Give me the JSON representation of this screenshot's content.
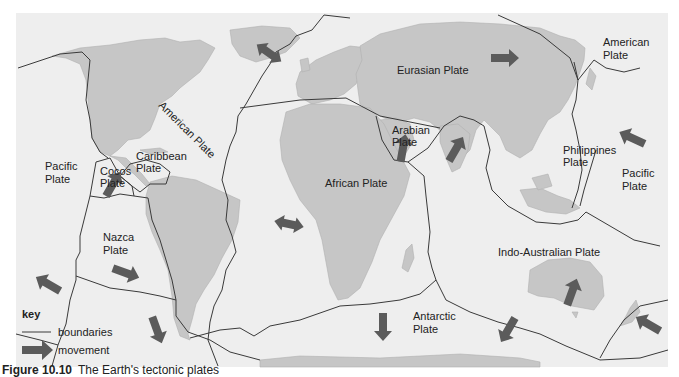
{
  "figure": {
    "caption_label": "Figure 10.10",
    "caption_text": "The Earth's tectonic plates"
  },
  "colors": {
    "ocean": "#eeeeee",
    "land": "#c6c6c6",
    "boundary": "#3a3a3a",
    "arrow": "#5b5b5b",
    "page": "#ffffff"
  },
  "plates": [
    {
      "id": "eurasian",
      "name": "Eurasian Plate"
    },
    {
      "id": "american-nw",
      "name": "American Plate"
    },
    {
      "id": "american-atl",
      "name": "American Plate"
    },
    {
      "id": "pacific-w",
      "name": "Pacific Plate"
    },
    {
      "id": "pacific-e",
      "name": "Pacific Plate"
    },
    {
      "id": "caribbean",
      "name": "Caribbean Plate"
    },
    {
      "id": "cocos",
      "name": "Cocos Plate"
    },
    {
      "id": "nazca",
      "name": "Nazca Plate"
    },
    {
      "id": "african",
      "name": "African Plate"
    },
    {
      "id": "arabian",
      "name": "Arabian Plate"
    },
    {
      "id": "philippines",
      "name": "Philippines Plate"
    },
    {
      "id": "indo-australian",
      "name": "Indo-Australian Plate"
    },
    {
      "id": "antarctic",
      "name": "Antarctic Plate"
    }
  ],
  "labels": {
    "eurasian": "Eurasian Plate",
    "american_ne_1": "American",
    "american_ne_2": "Plate",
    "american_atl": "American Plate",
    "pacific_w_1": "Pacific",
    "pacific_w_2": "Plate",
    "pacific_e_1": "Pacific",
    "pacific_e_2": "Plate",
    "caribbean_1": "Caribbean",
    "caribbean_2": "Plate",
    "cocos_1": "Cocos",
    "cocos_2": "Plate",
    "nazca_1": "Nazca",
    "nazca_2": "Plate",
    "african": "African Plate",
    "arabian_1": "Arabian",
    "arabian_2": "Plate",
    "philippines_1": "Philippines",
    "philippines_2": "Plate",
    "indo_australian": "Indo-Australian Plate",
    "antarctic_1": "Antarctic",
    "antarctic_2": "Plate"
  },
  "key": {
    "title": "key",
    "boundaries_label": "boundaries",
    "movement_label": "movement"
  }
}
